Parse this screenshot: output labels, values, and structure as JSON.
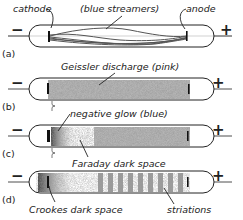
{
  "panels": [
    {
      "id": "a",
      "label": "(a)",
      "minus": "−",
      "plus": "+",
      "annotations": {
        "cathode": "cathode",
        "streamers": "(blue streamers)",
        "anode": "anode"
      }
    },
    {
      "id": "b",
      "label": "(b)",
      "minus": "−",
      "plus": "+",
      "annotations": {
        "discharge": "Geissler discharge (pink)"
      }
    },
    {
      "id": "c",
      "label": "(c)",
      "minus": "−",
      "plus": "+",
      "annotations": {
        "glow": "negative glow (blue)",
        "faraday": "Faraday dark space"
      }
    },
    {
      "id": "d",
      "label": "(d)",
      "minus": "−",
      "plus": "+",
      "annotations": {
        "crookes": "Crookes dark space",
        "striations": "striations"
      }
    }
  ],
  "colors": {
    "stroke": "#222222",
    "fill": "#9a9a9a",
    "background": "#ffffff"
  }
}
